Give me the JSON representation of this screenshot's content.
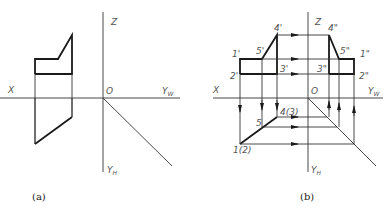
{
  "panels": [
    {
      "caption": "(a)",
      "axes": {
        "x": "X",
        "z": "Z",
        "origin": "O",
        "yw": "Y",
        "yw_sub": "W",
        "yh": "Y",
        "yh_sub": "H"
      }
    },
    {
      "caption": "(b)",
      "axes": {
        "x": "X",
        "z": "Z",
        "origin": "O",
        "yw": "Y",
        "yw_sub": "W",
        "yh": "Y",
        "yh_sub": "H"
      },
      "front_labels": {
        "p1": "1'",
        "p2": "2'",
        "p3": "3'",
        "p4": "4'",
        "p5": "5'"
      },
      "side_labels": {
        "p1": "1\"",
        "p2": "2\"",
        "p3": "3\"",
        "p4": "4\"",
        "p5": "5\""
      },
      "top_labels": {
        "p12": "1(2)",
        "p43": "4(3)",
        "p5": "5"
      }
    }
  ],
  "colors": {
    "line": "#1a1a1a",
    "label": "#555555"
  }
}
